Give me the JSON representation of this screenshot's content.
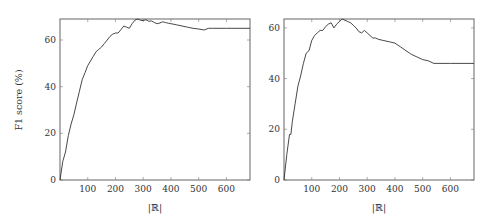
{
  "chart_data": [
    {
      "type": "line",
      "title": "",
      "xlabel": "|ℝ|",
      "ylabel": "F1 score (%)",
      "xlim": [
        0,
        685
      ],
      "ylim": [
        0,
        69
      ],
      "xticks": [
        "100",
        "200",
        "300",
        "400",
        "500",
        "600"
      ],
      "yticks": [
        "0",
        "20",
        "40",
        "60"
      ],
      "grid": false,
      "legend": null,
      "series": [
        {
          "name": "F1",
          "x": [
            0,
            10,
            20,
            30,
            40,
            50,
            60,
            70,
            80,
            90,
            100,
            110,
            120,
            130,
            140,
            150,
            160,
            170,
            180,
            190,
            200,
            210,
            220,
            230,
            240,
            250,
            260,
            270,
            280,
            290,
            300,
            310,
            320,
            330,
            340,
            350,
            360,
            370,
            380,
            390,
            400,
            420,
            440,
            460,
            480,
            500,
            520,
            535,
            550,
            600,
            685
          ],
          "y": [
            0,
            8,
            12,
            19,
            24,
            28,
            33,
            38,
            43,
            46,
            49,
            51,
            53,
            55,
            56,
            57,
            58.5,
            60,
            61.5,
            62.5,
            63,
            63,
            64.5,
            66,
            65.5,
            65,
            67,
            68.5,
            69,
            68.5,
            68.3,
            68.7,
            68,
            68.2,
            67.5,
            67,
            67.3,
            67.8,
            67.5,
            67.2,
            67,
            66.5,
            66,
            65.5,
            65,
            64.7,
            64.3,
            65,
            65,
            65,
            65
          ]
        }
      ]
    },
    {
      "type": "line",
      "title": "",
      "xlabel": "|ℝ|",
      "ylabel": "",
      "xlim": [
        0,
        685
      ],
      "ylim": [
        0,
        63.5
      ],
      "xticks": [
        "100",
        "200",
        "300",
        "400",
        "500",
        "600"
      ],
      "yticks": [
        "0",
        "20",
        "40",
        "60"
      ],
      "grid": false,
      "legend": null,
      "series": [
        {
          "name": "F1",
          "x": [
            0,
            10,
            20,
            25,
            30,
            40,
            50,
            60,
            70,
            80,
            90,
            100,
            110,
            120,
            130,
            140,
            150,
            160,
            170,
            180,
            190,
            200,
            210,
            220,
            230,
            240,
            250,
            260,
            270,
            280,
            290,
            300,
            310,
            320,
            330,
            340,
            360,
            380,
            400,
            420,
            440,
            460,
            480,
            500,
            520,
            540,
            555,
            600,
            685
          ],
          "y": [
            0,
            10,
            18,
            18,
            23,
            30,
            37,
            41,
            46,
            50,
            51,
            55,
            57,
            58,
            59,
            59,
            60.5,
            61.5,
            62,
            60,
            61.5,
            62.5,
            63.5,
            63,
            62.5,
            62,
            61,
            60,
            58.5,
            58,
            59,
            58,
            57,
            56,
            56,
            55.5,
            55,
            54.5,
            54,
            52.5,
            51,
            49.5,
            48.5,
            47.5,
            47,
            46,
            46,
            46,
            46
          ]
        }
      ]
    }
  ],
  "left_plot": {
    "ylabel": "F1 score (%)",
    "xlabel": "|ℝ|",
    "xticks": [
      "100",
      "200",
      "300",
      "400",
      "500",
      "600"
    ],
    "yticks": [
      "0",
      "20",
      "40",
      "60"
    ]
  },
  "right_plot": {
    "xlabel": "|ℝ|",
    "xticks": [
      "100",
      "200",
      "300",
      "400",
      "500",
      "600"
    ],
    "yticks": [
      "0",
      "20",
      "40",
      "60"
    ]
  }
}
